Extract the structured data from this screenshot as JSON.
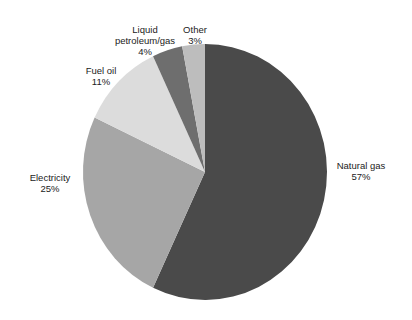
{
  "chart_data": {
    "type": "pie",
    "title": "",
    "categories": [
      "Natural gas",
      "Electricity",
      "Fuel oil",
      "Liquid petroleum/gas",
      "Other"
    ],
    "values": [
      57,
      25,
      11,
      4,
      3
    ],
    "unit": "%",
    "start_angle_deg_from_top": 0,
    "direction": "clockwise",
    "colors": [
      "#4a4a4a",
      "#a6a6a6",
      "#dcdcdc",
      "#6e6e6e",
      "#bdbdbd"
    ],
    "legend": "none (direct labels)",
    "labels": [
      {
        "name": "Natural gas",
        "value_text": "57%"
      },
      {
        "name": "Electricity",
        "value_text": "25%"
      },
      {
        "name": "Fuel oil",
        "value_text": "11%"
      },
      {
        "name": "Liquid petroleum/gas",
        "value_text": "4%"
      },
      {
        "name": "Other",
        "value_text": "3%"
      }
    ]
  },
  "labels": {
    "natural_gas": {
      "line1": "Natural gas",
      "line2": "57%"
    },
    "electricity": {
      "line1": "Electricity",
      "line2": "25%"
    },
    "fuel_oil": {
      "line1": "Fuel oil",
      "line2": "11%"
    },
    "lpg": {
      "line1": "Liquid",
      "line2": "petroleum/gas",
      "line3": "4%"
    },
    "other": {
      "line1": "Other",
      "line2": "3%"
    }
  }
}
